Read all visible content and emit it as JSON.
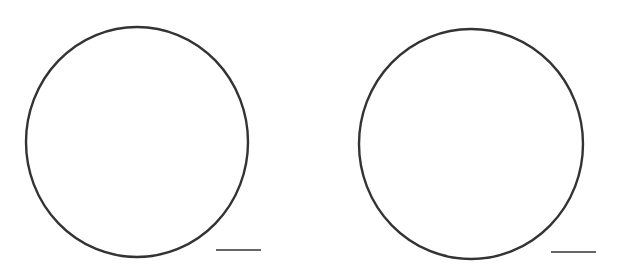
{
  "figure": {
    "background": "#ffffff",
    "stroke_color": "#333333",
    "panels": [
      {
        "name": "left",
        "circle": {
          "cx": 137,
          "cy": 142,
          "rx": 111,
          "ry": 115
        },
        "scale_bar": {
          "x1": 216,
          "x2": 261,
          "y": 250
        }
      },
      {
        "name": "right",
        "circle": {
          "cx": 471,
          "cy": 144,
          "rx": 112,
          "ry": 115
        },
        "scale_bar": {
          "x1": 551,
          "x2": 596,
          "y": 252
        }
      }
    ]
  }
}
